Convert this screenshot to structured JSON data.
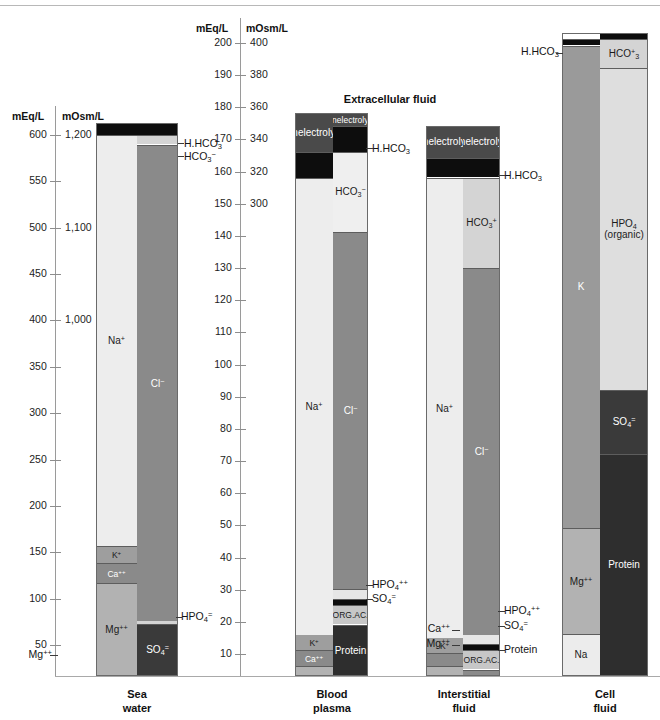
{
  "figure": {
    "section_title": "Extracellular fluid",
    "captions": [
      {
        "line1": "Sea",
        "line2": "water"
      },
      {
        "line1": "Blood",
        "line2": "plasma"
      },
      {
        "line1": "Interstitial",
        "line2": "fluid"
      },
      {
        "line1": "Cell",
        "line2": "fluid"
      }
    ]
  },
  "axes": {
    "left": {
      "unit_primary": "mEq/L",
      "unit_secondary": "mOsm/L",
      "primary_ticks": [
        "600",
        "550",
        "500",
        "450",
        "400",
        "350",
        "300",
        "250",
        "200",
        "150",
        "100",
        "50"
      ],
      "secondary_ticks": [
        "1,200",
        "1,100",
        "1,000"
      ]
    },
    "middle": {
      "unit_primary": "mEq/L",
      "unit_secondary": "mOsm/L",
      "primary_ticks": [
        "200",
        "190",
        "180",
        "170",
        "160",
        "150",
        "140",
        "130",
        "120",
        "110",
        "100",
        "90",
        "80",
        "70",
        "60",
        "50",
        "40",
        "30",
        "20",
        "10"
      ],
      "secondary_ticks": [
        "400",
        "380",
        "360",
        "340",
        "320",
        "300"
      ]
    }
  },
  "colors": {
    "na": "#ededed",
    "cl": "#8a8a8a",
    "k": "#9e9e9e",
    "ca": "#8a8a8a",
    "mg": "#b2b2b2",
    "so4": "#3a3a3a",
    "hco3": "#d4d4d4",
    "hpo4": "#e0e0e0",
    "protein": "#2e2e2e",
    "orgac": "#c7c7c7",
    "nonelectrolytes": "#4a4a4a",
    "hhco3": "#0d0d0d",
    "k_cell": "#9a9a9a",
    "hpo4_cell": "#dedede",
    "na_cell": "#ececec"
  },
  "chart_data": {
    "type": "bar",
    "xlabel": "",
    "ylabel": "mEq/L",
    "grid": false,
    "legend": "none",
    "axis_left": {
      "ylim": [
        0,
        620
      ],
      "secondary_ylim": [
        0,
        1240
      ],
      "unit": "mEq/L",
      "secondary_unit": "mOsm/L"
    },
    "axis_middle": {
      "ylim": [
        0,
        205
      ],
      "secondary_ylim": [
        0,
        410
      ],
      "unit": "mEq/L",
      "secondary_unit": "mOsm/L"
    },
    "columns": [
      {
        "name": "Sea water",
        "scale": "left",
        "cations": [
          {
            "label": "Mg++",
            "label_html": "Mg<sup>++</sup>",
            "value": 100,
            "from": 0,
            "to": 100,
            "color": "#b2b2b2",
            "placement": "inside"
          },
          {
            "label": "Ca++",
            "label_html": "Ca<sup>++</sup>",
            "value": 22,
            "from": 100,
            "to": 122,
            "color": "#8a8a8a",
            "placement": "inside"
          },
          {
            "label": "K+",
            "label_html": "K<sup>+</sup>",
            "value": 18,
            "from": 122,
            "to": 140,
            "color": "#9e9e9e",
            "placement": "inside"
          },
          {
            "label": "Na+",
            "label_html": "Na<sup>+</sup>",
            "value": 443,
            "from": 140,
            "to": 583,
            "color": "#ededed",
            "placement": "inside"
          },
          {
            "label": "H.HCO3",
            "label_html": "H.HCO<sub>3</sub>",
            "value": 13,
            "from": 583,
            "to": 596,
            "color": "#0d0d0d",
            "placement": "callout"
          }
        ],
        "anions": [
          {
            "label": "SO4=",
            "label_html": "SO<sub>4</sub><sup>=</sup>",
            "value": 56,
            "from": 0,
            "to": 56,
            "color": "#3a3a3a",
            "placement": "inside"
          },
          {
            "label": "HPO4=",
            "label_html": "HPO<sub>4</sub><sup>=</sup>",
            "value": 4,
            "from": 56,
            "to": 60,
            "color": "#d4d4d4",
            "placement": "callout"
          },
          {
            "label": "Cl-",
            "label_html": "Cl<sup>−</sup>",
            "value": 513,
            "from": 60,
            "to": 573,
            "color": "#8a8a8a",
            "placement": "inside"
          },
          {
            "label": "HCO3-",
            "label_html": "HCO<sub>3</sub><sup>−</sup>",
            "value": 10,
            "from": 573,
            "to": 583,
            "color": "#d4d4d4",
            "placement": "callout"
          },
          {
            "label": "H.HCO3",
            "label_html": "H.HCO<sub>3</sub>",
            "value": 13,
            "from": 583,
            "to": 596,
            "color": "#0d0d0d",
            "placement": "callout"
          }
        ]
      },
      {
        "name": "Blood plasma",
        "scale": "middle",
        "cations": [
          {
            "label": "Mg++",
            "label_html": "Mg<sup>++</sup>",
            "value": 3,
            "from": 0,
            "to": 3,
            "color": "#b2b2b2",
            "placement": "callout"
          },
          {
            "label": "Ca++",
            "label_html": "Ca<sup>++</sup>",
            "value": 5,
            "from": 3,
            "to": 8,
            "color": "#8a8a8a",
            "placement": "inside"
          },
          {
            "label": "K+",
            "label_html": "K<sup>+</sup>",
            "value": 5,
            "from": 8,
            "to": 13,
            "color": "#9e9e9e",
            "placement": "inside"
          },
          {
            "label": "Na+",
            "label_html": "Na<sup>+</sup>",
            "value": 142,
            "from": 13,
            "to": 155,
            "color": "#ededed",
            "placement": "inside"
          },
          {
            "label": "H.HCO3",
            "label_html": "H.HCO<sub>3</sub>",
            "value": 8,
            "from": 155,
            "to": 163,
            "color": "#0d0d0d",
            "placement": "callout"
          },
          {
            "label": "Nonelectrolytes",
            "label_html": "Nonelectrolytes",
            "value": 12,
            "from": 163,
            "to": 175,
            "color": "#4a4a4a",
            "placement": "inside"
          }
        ],
        "anions": [
          {
            "label": "Protein",
            "label_html": "Protein",
            "value": 16,
            "from": 0,
            "to": 16,
            "color": "#2e2e2e",
            "placement": "inside"
          },
          {
            "label": "ORG.AC.",
            "label_html": "ORG.AC.",
            "value": 6,
            "from": 16,
            "to": 22,
            "color": "#c7c7c7",
            "placement": "inside"
          },
          {
            "label": "SO4=",
            "label_html": "SO<sub>4</sub><sup>=</sup>",
            "value": 2,
            "from": 22,
            "to": 24,
            "color": "#0d0d0d",
            "placement": "callout"
          },
          {
            "label": "HPO4++",
            "label_html": "HPO<sub>4</sub><sup>++</sup>",
            "value": 3,
            "from": 24,
            "to": 27,
            "color": "#e6e6e6",
            "placement": "callout"
          },
          {
            "label": "Cl-",
            "label_html": "Cl<sup>−</sup>",
            "value": 111,
            "from": 27,
            "to": 138,
            "color": "#8a8a8a",
            "placement": "inside"
          },
          {
            "label": "HCO3-",
            "label_html": "HCO<sub>3</sub><sup>−</sup>",
            "value": 25,
            "from": 138,
            "to": 163,
            "color": "#efefef",
            "placement": "inside"
          },
          {
            "label": "H.HCO3",
            "label_html": "H.HCO<sub>3</sub>",
            "value": 8,
            "from": 163,
            "to": 171,
            "color": "#0d0d0d",
            "placement": "callout"
          },
          {
            "label": "Nonelectrolytes",
            "label_html": "Nonelectrolytes",
            "value": 4,
            "from": 171,
            "to": 175,
            "color": "#4a4a4a",
            "placement": "inside"
          }
        ]
      },
      {
        "name": "Interstitial fluid",
        "scale": "middle",
        "cations": [
          {
            "label": "Mg++",
            "label_html": "Mg<sup>++</sup>",
            "value": 3,
            "from": 0,
            "to": 3,
            "color": "#b2b2b2",
            "placement": "callout"
          },
          {
            "label": "Ca++",
            "label_html": "Ca<sup>++</sup>",
            "value": 4,
            "from": 3,
            "to": 7,
            "color": "#8a8a8a",
            "placement": "callout"
          },
          {
            "label": "K+",
            "label_html": "K<sup>+</sup>",
            "value": 5,
            "from": 7,
            "to": 12,
            "color": "#9e9e9e",
            "placement": "inside"
          },
          {
            "label": "Na+",
            "label_html": "Na<sup>+</sup>",
            "value": 143,
            "from": 12,
            "to": 155,
            "color": "#ededed",
            "placement": "inside"
          },
          {
            "label": "H.HCO3",
            "label_html": "H.HCO<sub>3</sub>",
            "value": 6,
            "from": 155,
            "to": 161,
            "color": "#0d0d0d",
            "placement": "callout"
          },
          {
            "label": "Nonelectrolytes",
            "label_html": "Nonelectrolytes",
            "value": 10,
            "from": 161,
            "to": 171,
            "color": "#4a4a4a",
            "placement": "inside"
          }
        ],
        "anions": [
          {
            "label": "Protein",
            "label_html": "Protein",
            "value": 2,
            "from": 0,
            "to": 2,
            "color": "#8a8a8a",
            "placement": "callout"
          },
          {
            "label": "ORG.AC.",
            "label_html": "ORG.AC.",
            "value": 6,
            "from": 2,
            "to": 8,
            "color": "#c7c7c7",
            "placement": "inside"
          },
          {
            "label": "SO4=",
            "label_html": "SO<sub>4</sub><sup>=</sup>",
            "value": 2,
            "from": 8,
            "to": 10,
            "color": "#0d0d0d",
            "placement": "callout"
          },
          {
            "label": "HPO4++",
            "label_html": "HPO<sub>4</sub><sup>++</sup>",
            "value": 3,
            "from": 10,
            "to": 13,
            "color": "#e6e6e6",
            "placement": "callout"
          },
          {
            "label": "Cl-",
            "label_html": "Cl<sup>−</sup>",
            "value": 114,
            "from": 13,
            "to": 127,
            "color": "#8a8a8a",
            "placement": "inside"
          },
          {
            "label": "HCO3+",
            "label_html": "HCO<sub>3</sub><sup>+</sup>",
            "value": 28,
            "from": 127,
            "to": 155,
            "color": "#d4d4d4",
            "placement": "inside"
          },
          {
            "label": "H.HCO3",
            "label_html": "H.HCO<sub>3</sub>",
            "value": 6,
            "from": 155,
            "to": 161,
            "color": "#0d0d0d",
            "placement": "callout"
          },
          {
            "label": "Nonelectrolytes",
            "label_html": "Nonelectrolytes",
            "value": 10,
            "from": 161,
            "to": 171,
            "color": "#4a4a4a",
            "placement": "inside"
          }
        ]
      },
      {
        "name": "Cell fluid",
        "scale": "middle",
        "cations": [
          {
            "label": "Na",
            "label_html": "Na",
            "value": 13,
            "from": 0,
            "to": 13,
            "color": "#ececec",
            "placement": "inside"
          },
          {
            "label": "Mg++",
            "label_html": "Mg<sup>++</sup>",
            "value": 33,
            "from": 13,
            "to": 46,
            "color": "#b2b2b2",
            "placement": "inside"
          },
          {
            "label": "K",
            "label_html": "K",
            "value": 150,
            "from": 46,
            "to": 196,
            "color": "#9a9a9a",
            "placement": "inside"
          },
          {
            "label": "H.HCO3",
            "label_html": "H.HCO<sub>3</sub>",
            "value": 2,
            "from": 196,
            "to": 198,
            "color": "#0d0d0d",
            "placement": "callout"
          }
        ],
        "anions": [
          {
            "label": "Protein",
            "label_html": "Protein",
            "value": 69,
            "from": 0,
            "to": 69,
            "color": "#2e2e2e",
            "placement": "inside"
          },
          {
            "label": "SO4=",
            "label_html": "SO<sub>4</sub><sup>=</sup>",
            "value": 20,
            "from": 69,
            "to": 89,
            "color": "#3a3a3a",
            "placement": "inside"
          },
          {
            "label": "HPO4 (organic)",
            "label_html": "HPO<sub>4</sub><br>(organic)",
            "value": 100,
            "from": 89,
            "to": 189,
            "color": "#dedede",
            "placement": "inside"
          },
          {
            "label": "HCO3+",
            "label_html": "HCO<sup>+</sup><sub>3</sub>",
            "value": 9,
            "from": 189,
            "to": 198,
            "color": "#d4d4d4",
            "placement": "inside"
          },
          {
            "label": "H.HCO3",
            "label_html": "H.HCO<sub>3</sub>",
            "value": 2,
            "from": 198,
            "to": 200,
            "color": "#0d0d0d",
            "placement": "callout"
          }
        ]
      }
    ]
  }
}
